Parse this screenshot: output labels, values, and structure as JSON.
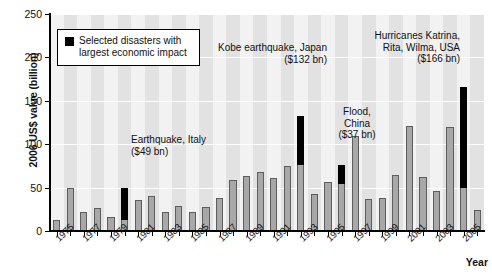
{
  "chart_data": {
    "type": "bar",
    "title": "",
    "xlabel": "Year",
    "ylabel": "2006 US$ value (billion)",
    "ylim": [
      0,
      250
    ],
    "yticks": [
      0,
      50,
      100,
      150,
      200,
      250
    ],
    "grid": true,
    "legend_position": "top-left",
    "legend": [
      {
        "swatch": "#000000",
        "label_line1": "Selected disasters with",
        "label_line2": "largest economic impact"
      }
    ],
    "categories": [
      "1975",
      "1976",
      "1977",
      "1978",
      "1979",
      "1980",
      "1981",
      "1982",
      "1983",
      "1984",
      "1985",
      "1986",
      "1987",
      "1988",
      "1989",
      "1990",
      "1991",
      "1992",
      "1993",
      "1994",
      "1995",
      "1996",
      "1997",
      "1998",
      "1999",
      "2000",
      "2001",
      "2002",
      "2003",
      "2004",
      "2005",
      "2006"
    ],
    "tick_labels": [
      "1975",
      "1977",
      "1979",
      "1981",
      "1983",
      "1985",
      "1987",
      "1989",
      "1991",
      "1993",
      "1995",
      "1997",
      "1999",
      "2001",
      "2003",
      "2005"
    ],
    "series": [
      {
        "name": "Total economic losses",
        "values": [
          13,
          50,
          22,
          27,
          16,
          49,
          36,
          40,
          22,
          29,
          22,
          28,
          38,
          59,
          63,
          68,
          61,
          75,
          132,
          43,
          57,
          76,
          110,
          37,
          38,
          65,
          121,
          62,
          46,
          120,
          166,
          24
        ]
      }
    ],
    "highlight_bars": [
      {
        "year": "1980",
        "total": 49,
        "grey_base": 11,
        "label": "Earthquake, Italy\n($49 bn)"
      },
      {
        "year": "1993",
        "total": 132,
        "grey_base": 75,
        "label": "Kobe earthquake, Japan\n($132 bn)"
      },
      {
        "year": "1996",
        "total": 76,
        "grey_base": 54,
        "label": "Flood,\nChina\n($37 bn)"
      },
      {
        "year": "2005",
        "total": 166,
        "grey_base": 48,
        "label": "Hurricanes Katrina,\nRita, Wilma, USA\n($166 bn)"
      }
    ],
    "colors": {
      "bar_fill": "#a8a8a8",
      "bar_stroke": "#5d5d5d",
      "highlight": "#000000",
      "plot_background": "#f2f2f2",
      "stripe": "#e2e2e2",
      "gridline": "#ffffff"
    },
    "annotations": [
      {
        "id": "italy",
        "line1": "Earthquake, Italy",
        "line2": "($49 bn)",
        "line3": ""
      },
      {
        "id": "kobe",
        "line1": "Kobe earthquake, Japan",
        "line2": "($132 bn)",
        "line3": ""
      },
      {
        "id": "flood",
        "line1": "Flood,",
        "line2": "China",
        "line3": "($37 bn)"
      },
      {
        "id": "katrina",
        "line1": "Hurricanes Katrina,",
        "line2": "Rita, Wilma, USA",
        "line3": "($166 bn)"
      }
    ]
  }
}
